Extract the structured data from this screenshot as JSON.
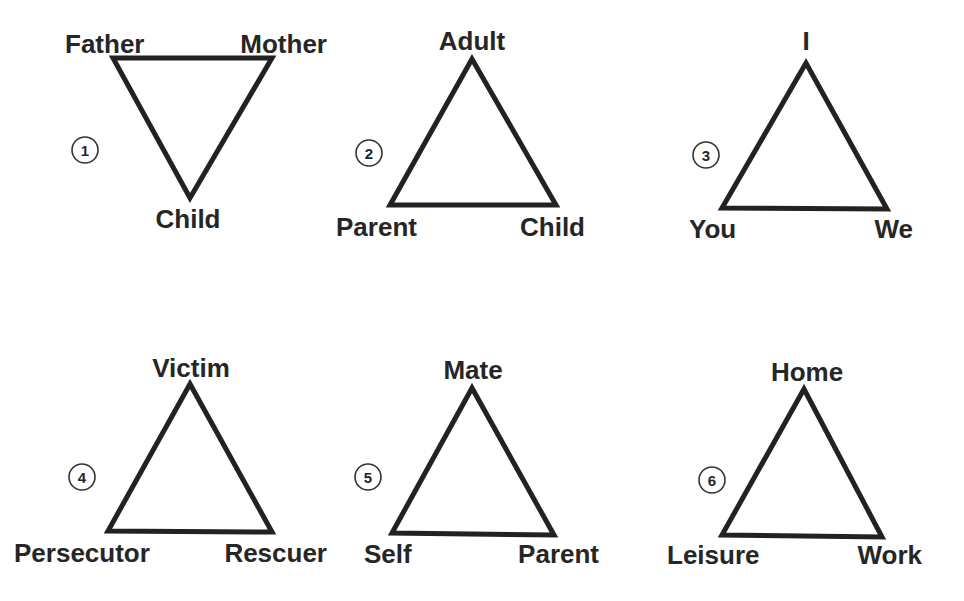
{
  "diagram": {
    "background": "#ffffff",
    "ink_color": "#222222",
    "triangles": [
      {
        "number": "1",
        "orientation": "inverted",
        "points": [
          [
            113,
            58
          ],
          [
            272,
            58
          ],
          [
            190,
            198
          ]
        ],
        "number_circle": {
          "cx": 85,
          "cy": 150
        },
        "labels": [
          {
            "text": "Father",
            "x": 65,
            "y": 53,
            "anchor": "start"
          },
          {
            "text": "Mother",
            "x": 327,
            "y": 53,
            "anchor": "end"
          },
          {
            "text": "Child",
            "x": 188,
            "y": 228,
            "anchor": "middle"
          }
        ]
      },
      {
        "number": "2",
        "orientation": "upright",
        "points": [
          [
            472,
            59
          ],
          [
            390,
            205
          ],
          [
            556,
            205
          ]
        ],
        "number_circle": {
          "cx": 369,
          "cy": 153
        },
        "labels": [
          {
            "text": "Adult",
            "x": 472,
            "y": 50,
            "anchor": "middle"
          },
          {
            "text": "Parent",
            "x": 336,
            "y": 236,
            "anchor": "start"
          },
          {
            "text": "Child",
            "x": 585,
            "y": 236,
            "anchor": "end"
          }
        ]
      },
      {
        "number": "3",
        "orientation": "upright",
        "points": [
          [
            806,
            63
          ],
          [
            722,
            208
          ],
          [
            887,
            209
          ]
        ],
        "number_circle": {
          "cx": 706,
          "cy": 155
        },
        "labels": [
          {
            "text": "I",
            "x": 806,
            "y": 50,
            "anchor": "middle"
          },
          {
            "text": "You",
            "x": 689,
            "y": 238,
            "anchor": "start"
          },
          {
            "text": "We",
            "x": 913,
            "y": 238,
            "anchor": "end"
          }
        ]
      },
      {
        "number": "4",
        "orientation": "upright",
        "points": [
          [
            190,
            384
          ],
          [
            108,
            531
          ],
          [
            272,
            532
          ]
        ],
        "number_circle": {
          "cx": 82,
          "cy": 477
        },
        "labels": [
          {
            "text": "Victim",
            "x": 191,
            "y": 377,
            "anchor": "middle"
          },
          {
            "text": "Persecutor",
            "x": 14,
            "y": 562,
            "anchor": "start"
          },
          {
            "text": "Rescuer",
            "x": 327,
            "y": 562,
            "anchor": "end"
          }
        ]
      },
      {
        "number": "5",
        "orientation": "upright",
        "points": [
          [
            472,
            388
          ],
          [
            392,
            533
          ],
          [
            554,
            535
          ]
        ],
        "number_circle": {
          "cx": 368,
          "cy": 477
        },
        "labels": [
          {
            "text": "Mate",
            "x": 473,
            "y": 379,
            "anchor": "middle"
          },
          {
            "text": "Self",
            "x": 364,
            "y": 563,
            "anchor": "start"
          },
          {
            "text": "Parent",
            "x": 599,
            "y": 563,
            "anchor": "end"
          }
        ]
      },
      {
        "number": "6",
        "orientation": "upright",
        "points": [
          [
            804,
            389
          ],
          [
            722,
            535
          ],
          [
            882,
            537
          ]
        ],
        "number_circle": {
          "cx": 712,
          "cy": 480
        },
        "labels": [
          {
            "text": "Home",
            "x": 807,
            "y": 381,
            "anchor": "middle"
          },
          {
            "text": "Leisure",
            "x": 667,
            "y": 564,
            "anchor": "start"
          },
          {
            "text": "Work",
            "x": 922,
            "y": 564,
            "anchor": "end"
          }
        ]
      }
    ]
  }
}
